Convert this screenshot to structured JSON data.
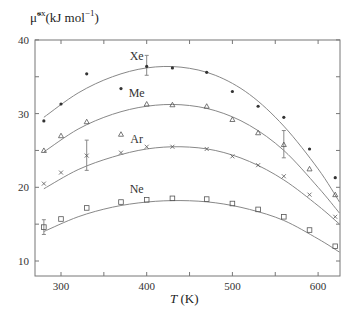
{
  "chart_data": {
    "type": "scatter",
    "title": "",
    "ylabel": "μ̃ex (kJ mol⁻¹)",
    "ylabel_parts": {
      "symbol": "μ̃",
      "sup": "ex",
      "unit": "(kJ mol",
      "unit_sup": "−1",
      "unit_end": ")"
    },
    "xlabel": "T (K)",
    "xlabel_parts": {
      "symbol": "T",
      "unit": " (K)"
    },
    "xlim": [
      280,
      625
    ],
    "ylim": [
      7,
      40
    ],
    "x_ticks": [
      300,
      400,
      500,
      600
    ],
    "x_minor_ticks": [
      350,
      450,
      550
    ],
    "y_ticks": [
      10,
      20,
      30,
      40
    ],
    "y_minor_ticks": [
      15,
      25,
      35
    ],
    "grid": false,
    "legend": "inline labels",
    "series": [
      {
        "name": "Xe",
        "marker": "asterisk",
        "label_pos": [
          400,
          37.3
        ],
        "points": [
          [
            280,
            29
          ],
          [
            300,
            31.3
          ],
          [
            330,
            35.4
          ],
          [
            370,
            33.4
          ],
          [
            400,
            36.4
          ],
          [
            430,
            36.2
          ],
          [
            470,
            35.6
          ],
          [
            500,
            33.0
          ],
          [
            530,
            31.0
          ],
          [
            560,
            29.5
          ],
          [
            590,
            25.2
          ],
          [
            620,
            21.3
          ]
        ],
        "fit": [
          [
            280,
            29.5
          ],
          [
            320,
            32.8
          ],
          [
            360,
            35.0
          ],
          [
            400,
            36.2
          ],
          [
            440,
            36.3
          ],
          [
            480,
            35.2
          ],
          [
            520,
            32.6
          ],
          [
            560,
            28.3
          ],
          [
            600,
            22.5
          ],
          [
            625,
            18.0
          ]
        ]
      },
      {
        "name": "Me",
        "marker": "triangle",
        "label_pos": [
          400,
          32.2
        ],
        "points": [
          [
            280,
            25.0
          ],
          [
            300,
            27.0
          ],
          [
            330,
            28.9
          ],
          [
            370,
            27.2
          ],
          [
            400,
            31.3
          ],
          [
            430,
            31.2
          ],
          [
            470,
            31.0
          ],
          [
            500,
            29.2
          ],
          [
            530,
            27.4
          ],
          [
            560,
            25.8
          ],
          [
            590,
            22.5
          ],
          [
            620,
            19.0
          ]
        ],
        "fit": [
          [
            280,
            24.8
          ],
          [
            320,
            27.9
          ],
          [
            360,
            29.9
          ],
          [
            400,
            31.0
          ],
          [
            440,
            31.2
          ],
          [
            480,
            30.4
          ],
          [
            520,
            28.4
          ],
          [
            560,
            25.0
          ],
          [
            600,
            20.0
          ],
          [
            625,
            16.5
          ]
        ]
      },
      {
        "name": "Ar",
        "marker": "cross",
        "label_pos": [
          400,
          26.0
        ],
        "points": [
          [
            280,
            20.5
          ],
          [
            300,
            22.0
          ],
          [
            330,
            24.3
          ],
          [
            370,
            24.7
          ],
          [
            400,
            25.5
          ],
          [
            430,
            25.5
          ],
          [
            470,
            25.2
          ],
          [
            500,
            24.2
          ],
          [
            530,
            23.0
          ],
          [
            560,
            21.5
          ],
          [
            590,
            19.0
          ],
          [
            620,
            16.0
          ]
        ],
        "fit": [
          [
            280,
            19.8
          ],
          [
            320,
            22.4
          ],
          [
            360,
            24.1
          ],
          [
            400,
            25.2
          ],
          [
            440,
            25.5
          ],
          [
            480,
            25.0
          ],
          [
            520,
            23.5
          ],
          [
            560,
            21.0
          ],
          [
            600,
            17.5
          ],
          [
            625,
            15.0
          ]
        ]
      },
      {
        "name": "Ne",
        "marker": "square",
        "label_pos": [
          400,
          19.2
        ],
        "points": [
          [
            280,
            14.6
          ],
          [
            300,
            15.7
          ],
          [
            330,
            17.2
          ],
          [
            370,
            18.0
          ],
          [
            400,
            18.3
          ],
          [
            430,
            18.5
          ],
          [
            470,
            18.4
          ],
          [
            500,
            17.8
          ],
          [
            530,
            17.0
          ],
          [
            560,
            16.0
          ],
          [
            590,
            14.2
          ],
          [
            620,
            12.0
          ]
        ],
        "fit": [
          [
            280,
            14.0
          ],
          [
            320,
            16.0
          ],
          [
            360,
            17.3
          ],
          [
            400,
            18.0
          ],
          [
            440,
            18.2
          ],
          [
            480,
            17.9
          ],
          [
            520,
            17.0
          ],
          [
            560,
            15.5
          ],
          [
            600,
            13.0
          ],
          [
            625,
            11.2
          ]
        ]
      }
    ],
    "error_bars": [
      {
        "series": "Xe",
        "x": 400,
        "y": 36.4,
        "low": 35.2,
        "high": 37.9
      },
      {
        "series": "Me",
        "x": 560,
        "y": 25.8,
        "low": 24.0,
        "high": 27.7
      },
      {
        "series": "Ar",
        "x": 330,
        "y": 24.3,
        "low": 22.3,
        "high": 26.4
      },
      {
        "series": "Ne",
        "x": 280,
        "y": 14.6,
        "low": 13.6,
        "high": 15.6
      }
    ]
  }
}
